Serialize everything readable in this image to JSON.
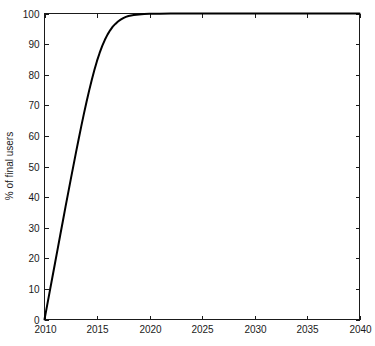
{
  "chart_data": {
    "type": "line",
    "title": "",
    "subtitle": "",
    "xlabel": "",
    "ylabel": "% of final users",
    "xlim": [
      2010,
      2040
    ],
    "ylim": [
      0,
      100
    ],
    "grid": false,
    "legend": null,
    "x_ticks": [
      2010,
      2015,
      2020,
      2025,
      2030,
      2035,
      2040
    ],
    "x_tick_labels": [
      "2010",
      "2015",
      "2020",
      "2025",
      "2030",
      "2035",
      "2040"
    ],
    "y_ticks": [
      0,
      10,
      20,
      30,
      40,
      50,
      60,
      70,
      80,
      90,
      100
    ],
    "y_tick_labels": [
      "0",
      "10",
      "20",
      "30",
      "40",
      "50",
      "60",
      "70",
      "80",
      "90",
      "100"
    ],
    "series": [
      {
        "name": "% of final users",
        "color": "#000000",
        "line_width": 2,
        "x": [
          2010.0,
          2010.25,
          2010.5,
          2010.75,
          2011.0,
          2011.25,
          2011.5,
          2011.75,
          2012.0,
          2012.25,
          2012.5,
          2012.75,
          2013.0,
          2013.25,
          2013.5,
          2013.75,
          2014.0,
          2014.25,
          2014.5,
          2014.75,
          2015.0,
          2015.25,
          2015.5,
          2015.75,
          2016.0,
          2016.25,
          2016.5,
          2016.75,
          2017.0,
          2017.25,
          2017.5,
          2017.75,
          2018.0,
          2018.5,
          2019.0,
          2019.5,
          2020.0,
          2021.0,
          2022.0,
          2023.0,
          2024.0,
          2025.0,
          2026.0,
          2027.0,
          2028.0,
          2029.0,
          2030.0,
          2031.0,
          2032.0,
          2033.0,
          2034.0,
          2035.0,
          2036.0,
          2037.0,
          2038.0,
          2039.0,
          2040.0
        ],
        "y": [
          0.0,
          4.6,
          9.2,
          13.8,
          18.4,
          23.0,
          27.6,
          32.2,
          36.8,
          41.3,
          45.8,
          50.2,
          54.6,
          58.9,
          63.1,
          67.2,
          71.1,
          74.8,
          78.3,
          81.5,
          84.5,
          87.1,
          89.4,
          91.4,
          93.1,
          94.5,
          95.7,
          96.6,
          97.4,
          98.0,
          98.5,
          98.9,
          99.2,
          99.5,
          99.7,
          99.8,
          99.9,
          99.95,
          99.97,
          99.98,
          99.99,
          100.0,
          100.0,
          100.0,
          100.0,
          100.0,
          100.0,
          100.0,
          100.0,
          100.0,
          100.0,
          100.0,
          100.0,
          100.0,
          100.0,
          100.0,
          100.0
        ]
      }
    ]
  },
  "axes": {
    "y_axis_label": "% of final users"
  }
}
